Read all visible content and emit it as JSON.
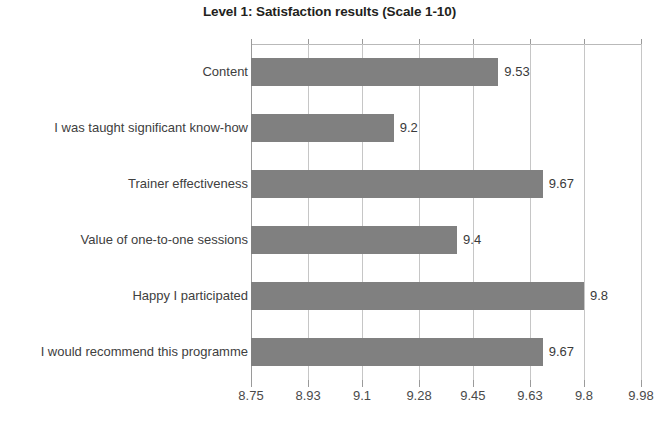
{
  "chart_data": {
    "type": "bar",
    "orientation": "horizontal",
    "title": "Level 1: Satisfaction results (Scale 1-10)",
    "xlabel": "",
    "ylabel": "",
    "categories": [
      "Content",
      "I was taught significant know-how",
      "Trainer effectiveness",
      "Value of one-to-one sessions",
      "Happy I participated",
      "I would recommend this programme"
    ],
    "values": [
      9.53,
      9.2,
      9.67,
      9.4,
      9.8,
      9.67
    ],
    "value_labels": [
      "9.53",
      "9.2",
      "9.67",
      "9.4",
      "9.8",
      "9.67"
    ],
    "xticks": [
      8.75,
      8.93,
      9.1,
      9.28,
      9.45,
      9.63,
      9.8,
      9.98
    ],
    "xtick_labels": [
      "8.75",
      "8.93",
      "9.1",
      "9.28",
      "9.45",
      "9.63",
      "9.8",
      "9.98"
    ],
    "xlim": [
      8.75,
      9.98
    ],
    "grid": "vertical",
    "legend": "none",
    "bar_color": "#808080",
    "gridline_color": "#c6c6c6",
    "axis_color": "#9a9a9a",
    "title_color": "#231f20",
    "label_color": "#404040",
    "background": "#ffffff"
  }
}
